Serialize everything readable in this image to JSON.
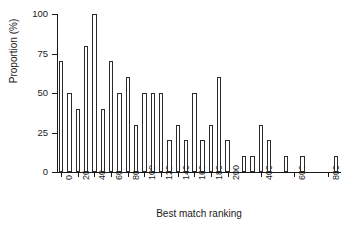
{
  "chart_data": {
    "type": "bar",
    "title": "",
    "xlabel": "Best match ranking",
    "ylabel": "Proportion (%)",
    "ylim": [
      0,
      100
    ],
    "yticks": [
      0,
      25,
      50,
      75,
      100
    ],
    "ytick_labels": [
      "0",
      "25",
      "50",
      "75",
      "100"
    ],
    "grid": false,
    "legend": "none",
    "bar_style": {
      "fill": "#ffffff",
      "edge": "#2b2b2b",
      "edge_width_px": 1
    },
    "categories": [
      "0",
      "10",
      "20",
      "30",
      "40",
      "50",
      "60",
      "70",
      "80",
      "90",
      "100",
      "110",
      "120",
      "130",
      "140",
      "150",
      "160",
      "170",
      "180",
      "190",
      "200",
      "250",
      "300",
      "350",
      "400",
      "450",
      "500",
      "550",
      "600",
      "650",
      "700",
      "750",
      "800",
      "850"
    ],
    "xtick_labels": [
      "0",
      "20",
      "40",
      "60",
      "80",
      "100",
      "120",
      "140",
      "160",
      "180",
      "200",
      "400",
      "600",
      "800"
    ],
    "xtick_category_index": [
      0,
      2,
      4,
      6,
      8,
      10,
      12,
      14,
      16,
      18,
      20,
      24,
      28,
      32
    ],
    "values": [
      70,
      50,
      40,
      80,
      100,
      40,
      70,
      50,
      60,
      30,
      50,
      50,
      50,
      20,
      30,
      20,
      50,
      20,
      30,
      60,
      20,
      0,
      10,
      10,
      30,
      20,
      0,
      10,
      0,
      10,
      0,
      0,
      0,
      10
    ]
  },
  "figure": {
    "background_color": "#ffffff",
    "axis_color": "#1a1a1a"
  }
}
